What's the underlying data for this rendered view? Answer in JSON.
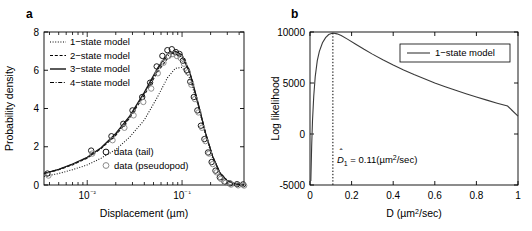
{
  "figure": {
    "panels": [
      {
        "label": "a",
        "axes": {
          "xlabel": "Displacement (µm)",
          "ylabel": "Probability density",
          "xticks": [
            "10⁻²",
            "10⁻¹"
          ],
          "yticks": [
            "0",
            "2",
            "4",
            "6",
            "8"
          ]
        },
        "legend_models": [
          {
            "label": "1−state model",
            "style": "dotted"
          },
          {
            "label": "2−state model",
            "style": "dashed-short"
          },
          {
            "label": "3−state model",
            "style": "solid"
          },
          {
            "label": "4−state model",
            "style": "dash-dot"
          }
        ],
        "legend_data": [
          {
            "label": "data (tail)",
            "marker": "circle-open-black"
          },
          {
            "label": "data (pseudopod)",
            "marker": "circle-open-gray"
          }
        ]
      },
      {
        "label": "b",
        "axes": {
          "xlabel": "D (µm²/sec)",
          "ylabel": "Log likelihood",
          "xticks": [
            "0",
            "0.2",
            "0.4",
            "0.6",
            "0.8",
            "1"
          ],
          "yticks": [
            "-5000",
            "0",
            "5000",
            "10000"
          ]
        },
        "legend": [
          {
            "label": "1−state model",
            "style": "solid"
          }
        ],
        "annotation": {
          "symbol": "D",
          "hat": "ˆ",
          "subscript": "1",
          "equals": " = 0.11(",
          "units_base": "µm",
          "units_exp": "2",
          "units_tail": "/sec)",
          "full_text": "D̂1 = 0.11(µm2/sec)"
        }
      }
    ]
  },
  "chart_data": [
    {
      "type": "line",
      "panel": "a",
      "title": "",
      "xlabel": "Displacement (µm)",
      "ylabel": "Probability density",
      "xscale": "log",
      "xlim": [
        0.0035,
        0.45
      ],
      "ylim": [
        0,
        8
      ],
      "grid": false,
      "legend_position": "top-left",
      "x": [
        0.0035,
        0.005,
        0.007,
        0.01,
        0.014,
        0.02,
        0.028,
        0.04,
        0.055,
        0.07,
        0.085,
        0.1,
        0.12,
        0.145,
        0.175,
        0.21,
        0.25,
        0.3,
        0.36,
        0.45
      ],
      "series": [
        {
          "name": "1−state model",
          "style": "dotted",
          "values": [
            0.45,
            0.6,
            0.8,
            1.05,
            1.4,
            1.85,
            2.5,
            3.4,
            4.6,
            5.6,
            6.1,
            6.15,
            5.6,
            4.3,
            2.7,
            1.4,
            0.6,
            0.2,
            0.05,
            0.02
          ]
        },
        {
          "name": "2−state model",
          "style": "dashed-short",
          "values": [
            0.6,
            0.8,
            1.05,
            1.4,
            1.9,
            2.6,
            3.5,
            4.7,
            5.9,
            6.6,
            6.85,
            6.7,
            5.9,
            4.4,
            2.8,
            1.5,
            0.65,
            0.22,
            0.06,
            0.02
          ]
        },
        {
          "name": "3−state model",
          "style": "solid",
          "values": [
            0.6,
            0.82,
            1.1,
            1.45,
            1.95,
            2.7,
            3.6,
            4.85,
            6.1,
            6.85,
            7.0,
            6.8,
            5.95,
            4.45,
            2.8,
            1.5,
            0.65,
            0.22,
            0.06,
            0.02
          ]
        },
        {
          "name": "4−state model",
          "style": "dash-dot",
          "values": [
            0.6,
            0.81,
            1.08,
            1.43,
            1.92,
            2.65,
            3.55,
            4.8,
            6.0,
            6.75,
            6.95,
            6.75,
            5.9,
            4.4,
            2.8,
            1.5,
            0.65,
            0.22,
            0.06,
            0.02
          ]
        }
      ],
      "scatter": [
        {
          "name": "data (tail)",
          "marker": "circle-open-black",
          "x": [
            0.0038,
            0.011,
            0.018,
            0.024,
            0.03,
            0.038,
            0.046,
            0.054,
            0.062,
            0.07,
            0.078,
            0.086,
            0.094,
            0.102,
            0.112,
            0.122,
            0.133,
            0.145,
            0.158,
            0.172,
            0.188,
            0.205,
            0.225,
            0.25,
            0.28,
            0.32,
            0.38,
            0.44
          ],
          "values": [
            0.6,
            1.8,
            2.55,
            3.2,
            3.9,
            4.6,
            5.35,
            6.2,
            6.75,
            7.05,
            7.1,
            6.95,
            6.85,
            6.5,
            6.0,
            5.4,
            4.6,
            3.9,
            3.1,
            2.4,
            1.7,
            1.2,
            0.75,
            0.4,
            0.18,
            0.08,
            0.04,
            0.03
          ]
        },
        {
          "name": "data (pseudopod)",
          "marker": "circle-open-gray",
          "x": [
            0.0038,
            0.011,
            0.018,
            0.024,
            0.03,
            0.038,
            0.046,
            0.054,
            0.062,
            0.07,
            0.078,
            0.086,
            0.094,
            0.102,
            0.112,
            0.122,
            0.133,
            0.145,
            0.158,
            0.172,
            0.188,
            0.205,
            0.225,
            0.25,
            0.28,
            0.32,
            0.38,
            0.44
          ],
          "values": [
            0.55,
            1.7,
            2.4,
            3.05,
            3.7,
            4.4,
            5.1,
            5.9,
            6.45,
            6.8,
            6.9,
            6.8,
            6.7,
            6.4,
            5.95,
            5.3,
            4.55,
            3.85,
            3.05,
            2.35,
            1.7,
            1.15,
            0.72,
            0.38,
            0.17,
            0.08,
            0.04,
            0.03
          ]
        }
      ]
    },
    {
      "type": "line",
      "panel": "b",
      "title": "",
      "xlabel": "D (µm²/sec)",
      "ylabel": "Log likelihood",
      "xscale": "linear",
      "xlim": [
        0,
        1
      ],
      "ylim": [
        -5000,
        10000
      ],
      "grid": false,
      "legend_position": "top-right",
      "peak": {
        "x": 0.11,
        "y": 9900
      },
      "vline": {
        "x": 0.11,
        "style": "dotted",
        "from": -5000,
        "to": 9900
      },
      "series": [
        {
          "name": "1−state model",
          "style": "solid",
          "x": [
            0.004,
            0.008,
            0.012,
            0.018,
            0.025,
            0.035,
            0.045,
            0.06,
            0.075,
            0.09,
            0.11,
            0.13,
            0.15,
            0.18,
            0.22,
            0.26,
            0.3,
            0.35,
            0.4,
            0.45,
            0.5,
            0.55,
            0.6,
            0.65,
            0.7,
            0.75,
            0.8,
            0.85,
            0.9,
            0.95,
            1.0
          ],
          "values": [
            -4600,
            -1200,
            1300,
            3700,
            5600,
            7200,
            8100,
            8950,
            9450,
            9750,
            9900,
            9820,
            9650,
            9300,
            8800,
            8300,
            7830,
            7280,
            6760,
            6280,
            5830,
            5410,
            5010,
            4640,
            4290,
            3950,
            3630,
            3320,
            3020,
            2740,
            1750
          ]
        }
      ]
    }
  ]
}
